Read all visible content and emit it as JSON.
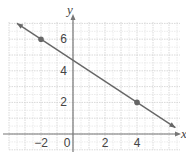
{
  "chart_data": {
    "type": "line",
    "title": "",
    "xlabel": "x",
    "ylabel": "y",
    "xlim": [
      -4,
      6.7
    ],
    "ylim": [
      -1,
      7.2
    ],
    "grid": true,
    "x_ticks": [
      -2,
      0,
      2,
      4
    ],
    "y_ticks": [
      2,
      4,
      6
    ],
    "x_tick_labels": [
      "−2",
      "0",
      "2",
      "4"
    ],
    "y_tick_labels": [
      "2",
      "4",
      "6"
    ],
    "series": [
      {
        "name": "line",
        "equation": "y = -2/3 x + 14/3",
        "x": [
          -3.5,
          6.4
        ],
        "y": [
          7.0,
          0.4
        ],
        "color": "#666666"
      }
    ],
    "points": [
      {
        "x": -2,
        "y": 6,
        "color": "#666666"
      },
      {
        "x": 4,
        "y": 2,
        "color": "#666666"
      }
    ]
  },
  "labels": {
    "x_axis": "x",
    "y_axis": "y",
    "origin": "0"
  }
}
